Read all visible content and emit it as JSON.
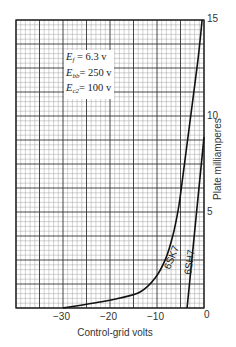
{
  "chart_data": {
    "type": "line",
    "title": "",
    "xlabel": "Control-grid volts",
    "ylabel": "Plate milliamperes",
    "xlim": [
      -40,
      0
    ],
    "ylim": [
      0,
      15
    ],
    "x_ticks": [
      "-30",
      "-20",
      "-10",
      "0"
    ],
    "y_ticks": [
      "0",
      "5",
      "10",
      "15"
    ],
    "grid": true,
    "legend_position": "upper-left (conditions box)",
    "conditions": [
      {
        "symbol": "E",
        "sub": "f",
        "text": " = 6.3 v"
      },
      {
        "symbol": "E",
        "sub": "bb",
        "text": "= 250 v"
      },
      {
        "symbol": "E",
        "sub": "c2",
        "text": "= 100 v"
      }
    ],
    "series": [
      {
        "name": "6SK7",
        "x": [
          -30,
          -22.1,
          -17.9,
          -13.6,
          -10.4,
          -8.1,
          -6.6,
          -5.5,
          -4.9,
          -3.2,
          -1.3,
          -0.4
        ],
        "y": [
          0,
          0.31,
          0.52,
          0.83,
          1.56,
          2.6,
          3.8,
          5.1,
          6.1,
          9.3,
          12.9,
          15
        ]
      },
      {
        "name": "6SH7",
        "x": [
          -3.6,
          0
        ],
        "y": [
          0,
          8.9
        ]
      }
    ]
  },
  "labels": {
    "x_axis": "Control-grid volts",
    "y_axis": "Plate milliamperes",
    "x_tick_m30": "−30",
    "x_tick_m20": "−20",
    "x_tick_m10": "−10",
    "x_tick_0": "0",
    "y_tick_5": "5",
    "y_tick_10": "10",
    "y_tick_15": "15",
    "curve_6sk7": "6SK7",
    "curve_6sh7": "6SH7",
    "cond_ef_sym": "E",
    "cond_ef_sub": "f",
    "cond_ef_val": " = 6.3 v",
    "cond_ebb_sym": "E",
    "cond_ebb_sub": "bb",
    "cond_ebb_val": "= 250 v",
    "cond_ec2_sym": "E",
    "cond_ec2_sub": "c2",
    "cond_ec2_val": "= 100 v"
  },
  "colors": {
    "grid_minor": "#9a9a9a",
    "grid_major": "#333333",
    "curve": "#111111",
    "background": "#ffffff"
  }
}
